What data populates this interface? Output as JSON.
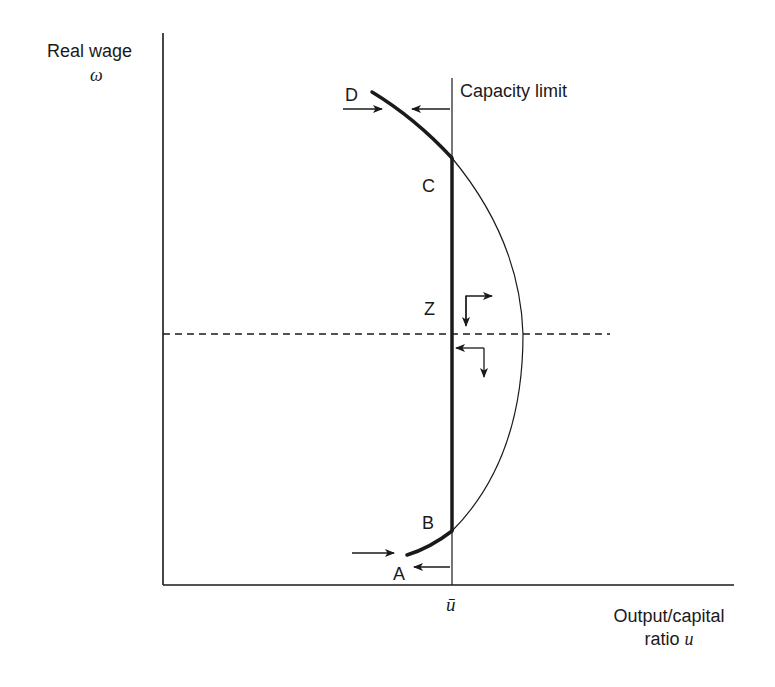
{
  "diagram": {
    "y_axis": {
      "label": "Real wage",
      "symbol": "ω"
    },
    "x_axis": {
      "label_line1": "Output/capital",
      "label_line2": "ratio",
      "symbol": "u",
      "tick_label": "ū"
    },
    "capacity_limit_label": "Capacity limit",
    "points": {
      "A": "A",
      "B": "B",
      "C": "C",
      "D": "D",
      "Z": "Z"
    },
    "colors": {
      "ink": "#1a1a1a",
      "background": "#ffffff"
    }
  }
}
